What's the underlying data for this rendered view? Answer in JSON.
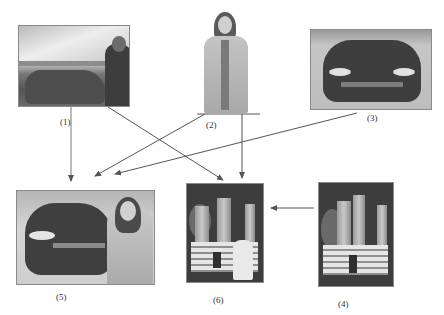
{
  "figure": {
    "nodes": [
      {
        "id": "1",
        "label": "(1)",
        "content": "photo of a man leaning on a car in a landscape"
      },
      {
        "id": "2",
        "label": "(2)",
        "content": "photo of a woman in a light jacket with a scarf"
      },
      {
        "id": "3",
        "label": "(3)",
        "content": "front view photo of a sports car"
      },
      {
        "id": "4",
        "label": "(4)",
        "content": "photo of a temple gate"
      },
      {
        "id": "5",
        "label": "(5)",
        "content": "composite of the sports car and the woman"
      },
      {
        "id": "6",
        "label": "(6)",
        "content": "composite of the temple gate and the person"
      }
    ],
    "edges": [
      {
        "from": "1",
        "to": "5"
      },
      {
        "from": "1",
        "to": "6"
      },
      {
        "from": "2",
        "to": "5"
      },
      {
        "from": "2",
        "to": "6"
      },
      {
        "from": "3",
        "to": "5"
      },
      {
        "from": "4",
        "to": "6"
      }
    ],
    "line_color": "#555555"
  }
}
